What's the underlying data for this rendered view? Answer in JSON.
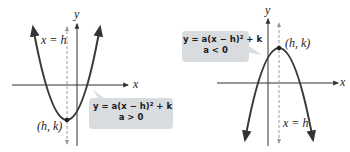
{
  "left_graph": {
    "y_axis_label": "y",
    "x_axis_label": "x",
    "axis_of_symmetry_label": "x = h",
    "vertex_label": "(h, k)",
    "callout": {
      "equation": "y = a(x − h)² + k",
      "condition": "a > 0"
    },
    "opens": "up"
  },
  "right_graph": {
    "y_axis_label": "y",
    "x_axis_label": "x",
    "axis_of_symmetry_label": "x = h",
    "vertex_label": "(h, k)",
    "callout": {
      "equation": "y = a(x − h)² + k",
      "condition": "a < 0"
    },
    "opens": "down"
  },
  "colors": {
    "curve": "#3a3a3a",
    "axis": "#333333",
    "dashed": "#888888",
    "callout_bg": "#d9dcdf"
  }
}
